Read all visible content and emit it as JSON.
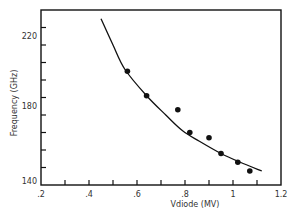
{
  "chart_data": {
    "type": "scatter",
    "title": "",
    "xlabel": "Vdiode (MV)",
    "ylabel": "Frequency (GHz)",
    "xlim": [
      0.2,
      1.2
    ],
    "ylim": [
      140,
      240
    ],
    "x_ticks": [
      0.2,
      0.3,
      0.4,
      0.5,
      0.6,
      0.7,
      0.8,
      0.9,
      1.0,
      1.1,
      1.2
    ],
    "x_tick_labels": [
      {
        "value": 0.2,
        "label": ".2"
      },
      {
        "value": 0.4,
        "label": ".4"
      },
      {
        "value": 0.6,
        "label": ".6"
      },
      {
        "value": 0.8,
        "label": ".8"
      },
      {
        "value": 1.0,
        "label": "1"
      },
      {
        "value": 1.2,
        "label": "1.2"
      }
    ],
    "y_ticks": [
      140,
      150,
      160,
      170,
      180,
      190,
      200,
      210,
      220,
      230
    ],
    "y_tick_labels": [
      {
        "value": 140,
        "label": "140"
      },
      {
        "value": 180,
        "label": "180"
      },
      {
        "value": 220,
        "label": "220"
      }
    ],
    "grid": false,
    "legend": null,
    "series": [
      {
        "name": "measured",
        "kind": "scatter",
        "marker": "filled-circle",
        "color": "#111111",
        "x": [
          0.56,
          0.64,
          0.77,
          0.82,
          0.9,
          0.95,
          1.02,
          1.07
        ],
        "y": [
          205,
          191,
          183,
          170,
          167,
          158,
          153,
          148
        ]
      },
      {
        "name": "fit",
        "kind": "line",
        "color": "#111111",
        "x": [
          0.45,
          0.5,
          0.55,
          0.64,
          0.72,
          0.79,
          0.86,
          0.95,
          1.03,
          1.12
        ],
        "y": [
          235,
          220,
          206,
          191,
          180,
          171,
          165,
          158,
          153,
          148
        ]
      }
    ]
  }
}
